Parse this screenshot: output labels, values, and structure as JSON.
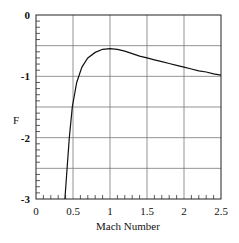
{
  "chart_data": {
    "type": "line",
    "title": "",
    "xlabel": "Mach Number",
    "ylabel": "F",
    "xlim": [
      0,
      2.5
    ],
    "ylim": [
      -3,
      0
    ],
    "grid": true,
    "x_ticks": [
      "0",
      "0.5",
      "1",
      "1.5",
      "2",
      "2.5"
    ],
    "y_ticks": [
      "0",
      "-1",
      "-2",
      "-3"
    ],
    "series": [
      {
        "name": "F",
        "x": [
          0.39,
          0.42,
          0.45,
          0.49,
          0.55,
          0.62,
          0.7,
          0.8,
          0.9,
          1.0,
          1.1,
          1.2,
          1.3,
          1.4,
          1.5,
          1.6,
          1.7,
          1.8,
          1.9,
          2.0,
          2.1,
          2.2,
          2.3,
          2.4,
          2.5
        ],
        "values": [
          -3.0,
          -2.5,
          -2.0,
          -1.5,
          -1.1,
          -0.85,
          -0.7,
          -0.61,
          -0.56,
          -0.55,
          -0.56,
          -0.59,
          -0.63,
          -0.67,
          -0.7,
          -0.73,
          -0.76,
          -0.79,
          -0.82,
          -0.85,
          -0.88,
          -0.91,
          -0.93,
          -0.96,
          -0.98
        ]
      }
    ]
  }
}
